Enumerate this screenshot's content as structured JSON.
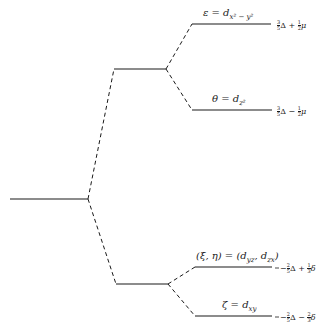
{
  "diagram": {
    "type": "energy-level-splitting",
    "levels": [
      {
        "id": "base",
        "label": ""
      },
      {
        "id": "eg",
        "label": ""
      },
      {
        "id": "t2g",
        "label": ""
      },
      {
        "id": "epsilon",
        "label_symbol": "ε",
        "label_eq": " = d",
        "label_sub": "x² − y²",
        "energy": {
          "sign": "",
          "a_num": "3",
          "a_den": "5",
          "term_a": "Δ",
          "op": "+",
          "b_num": "1",
          "b_den": "2",
          "term_b": "μ"
        }
      },
      {
        "id": "theta",
        "label_symbol": "θ",
        "label_eq": " = d",
        "label_sub": "z²",
        "energy": {
          "sign": "",
          "a_num": "3",
          "a_den": "5",
          "term_a": "Δ",
          "op": "−",
          "b_num": "1",
          "b_den": "2",
          "term_b": "μ"
        }
      },
      {
        "id": "xi-eta",
        "label_symbol": "(ξ, η)",
        "label_eq": " = (d",
        "label_sub": "yz",
        "label_mid": ", d",
        "label_sub2": "zx",
        "label_end": ")",
        "energy": {
          "sign": "−",
          "a_num": "2",
          "a_den": "5",
          "term_a": "Δ",
          "op": "+",
          "b_num": "1",
          "b_den": "3",
          "term_b": "δ"
        }
      },
      {
        "id": "zeta",
        "label_symbol": "ζ",
        "label_eq": " = d",
        "label_sub": "xy",
        "energy": {
          "sign": "−",
          "a_num": "2",
          "a_den": "5",
          "term_a": "Δ",
          "op": "−",
          "b_num": "2",
          "b_den": "3",
          "term_b": "δ"
        }
      }
    ]
  }
}
